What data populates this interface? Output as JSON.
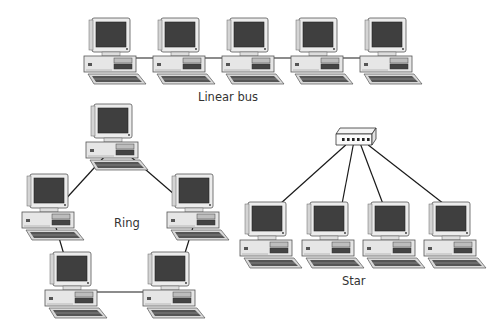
{
  "diagram": {
    "colors": {
      "line": "#1a1a1a",
      "screen": "#3f3f3f",
      "case": "#e6e6e6",
      "outline": "#555555",
      "text": "#333333"
    },
    "topologies": [
      {
        "id": "linear-bus",
        "label": "Linear bus",
        "label_pos": [
          226,
          97
        ],
        "nodes": [
          [
            84,
            18
          ],
          [
            153,
            18
          ],
          [
            222,
            18
          ],
          [
            291,
            18
          ],
          [
            360,
            18
          ]
        ],
        "links": [
          [
            0,
            1
          ],
          [
            1,
            2
          ],
          [
            2,
            3
          ],
          [
            3,
            4
          ]
        ]
      },
      {
        "id": "ring",
        "label": "Ring",
        "label_pos": [
          112,
          214
        ],
        "nodes": [
          [
            86,
            104
          ],
          [
            22,
            174
          ],
          [
            167,
            174
          ],
          [
            45,
            252
          ],
          [
            143,
            252
          ]
        ],
        "links": [
          [
            0,
            1
          ],
          [
            0,
            2
          ],
          [
            1,
            3
          ],
          [
            2,
            4
          ],
          [
            3,
            4
          ]
        ]
      },
      {
        "id": "star",
        "label": "Star",
        "label_pos": [
          342,
          272
        ],
        "hub": {
          "x": 336,
          "y": 128,
          "w": 40,
          "h": 17,
          "ports": 6
        },
        "nodes": [
          [
            240,
            202
          ],
          [
            302,
            202
          ],
          [
            363,
            202
          ],
          [
            424,
            202
          ]
        ]
      }
    ]
  }
}
